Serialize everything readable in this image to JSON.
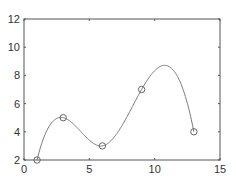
{
  "chart_data": {
    "type": "line",
    "title": "",
    "xlabel": "",
    "ylabel": "",
    "xlim": [
      0,
      15
    ],
    "ylim": [
      2,
      12
    ],
    "xticks": [
      0,
      5,
      10,
      15
    ],
    "yticks": [
      2,
      4,
      6,
      8,
      10,
      12
    ],
    "xtick_labels": [
      "0",
      "5",
      "10",
      "15"
    ],
    "ytick_labels": [
      "2",
      "4",
      "6",
      "8",
      "10",
      "12"
    ],
    "grid": false,
    "legend": null,
    "series": [
      {
        "name": "data points",
        "marker": "circle",
        "line": false,
        "x": [
          1,
          3,
          6,
          9,
          13
        ],
        "y": [
          2,
          5,
          3,
          7,
          4
        ]
      },
      {
        "name": "spline interpolation",
        "marker": "none",
        "line": true,
        "interpolation": "cubic spline",
        "x": [
          1,
          3,
          6,
          9,
          13
        ],
        "y": [
          2,
          5,
          3,
          7,
          4
        ]
      }
    ],
    "colors": {
      "axes": "#555555",
      "curve": "#777777",
      "marker": "#666666"
    }
  }
}
